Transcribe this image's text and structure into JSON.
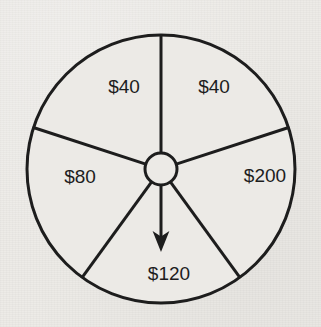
{
  "figure": {
    "kind": "spinner-wheel",
    "background_color": "#eceae6",
    "ink_color": "#1d1d1d"
  },
  "chart_data": {
    "type": "pie",
    "title": "",
    "subtitle": "",
    "xlabel": "",
    "ylabel": "",
    "grid": false,
    "legend": "none",
    "annotations": [
      "pointer arrow from hub pointing straight down into the $120 sector"
    ],
    "categories": [
      "$40",
      "$40",
      "$200",
      "$120",
      "$80"
    ],
    "values": [
      72,
      72,
      72,
      72,
      72
    ],
    "units": "degrees",
    "slices": [
      {
        "label": "$40",
        "amount": 40,
        "start_angle_deg": 270,
        "end_angle_deg": 342,
        "sweep_deg": 72,
        "label_x": 124,
        "label_y": 88,
        "fill": "#eceae6"
      },
      {
        "label": "$40",
        "amount": 40,
        "start_angle_deg": 342,
        "end_angle_deg": 54,
        "sweep_deg": 72,
        "label_x": 214,
        "label_y": 88,
        "fill": "#eceae6"
      },
      {
        "label": "$200",
        "amount": 200,
        "start_angle_deg": 54,
        "end_angle_deg": 126,
        "sweep_deg": 72,
        "label_x": 265,
        "label_y": 177,
        "fill": "#eceae6"
      },
      {
        "label": "$120",
        "amount": 120,
        "start_angle_deg": 126,
        "end_angle_deg": 198,
        "sweep_deg": 72,
        "label_x": 169,
        "label_y": 275,
        "fill": "#eceae6"
      },
      {
        "label": "$80",
        "amount": 80,
        "start_angle_deg": 198,
        "end_angle_deg": 270,
        "sweep_deg": 72,
        "label_x": 80,
        "label_y": 178,
        "fill": "#eceae6"
      }
    ],
    "geometry": {
      "center_x": 161,
      "center_y": 169,
      "radius": 134,
      "hub_radius": 17,
      "rim_stroke_width": 3,
      "spoke_stroke_width": 3,
      "pointer_angle_deg": 90,
      "pointer_length": 66
    }
  }
}
